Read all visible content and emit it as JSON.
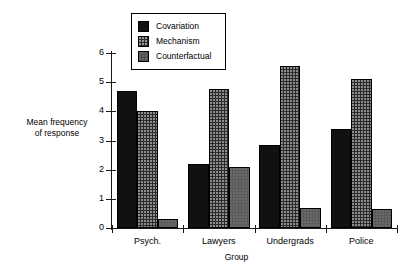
{
  "chart_data": {
    "type": "bar",
    "title": "",
    "xlabel": "Group",
    "ylabel": "Mean frequency\nof response",
    "ylabel_lines": [
      "Mean frequency",
      "of response"
    ],
    "categories": [
      "Psych.",
      "Lawyers",
      "Undergrads",
      "Police"
    ],
    "series": [
      {
        "name": "Covariation",
        "values": [
          4.7,
          2.2,
          2.85,
          3.4
        ]
      },
      {
        "name": "Mechanism",
        "values": [
          4.0,
          4.75,
          5.55,
          5.1
        ]
      },
      {
        "name": "Counterfactual",
        "values": [
          0.3,
          2.1,
          0.7,
          0.65
        ]
      }
    ],
    "ylim": [
      0,
      6
    ],
    "yticks": [
      0,
      1,
      2,
      3,
      4,
      5,
      6
    ],
    "ytick_labels": [
      "0",
      "1",
      "2",
      "3",
      "4",
      "5",
      "6"
    ],
    "grid": false,
    "legend_position": "top-left-inside",
    "series_colors": [
      "#111111",
      "#2b2b2b",
      "#5a5a5a"
    ],
    "axis_color": "#1a1a1a"
  },
  "legend": {
    "items": [
      {
        "label": "Covariation",
        "key": "covariation"
      },
      {
        "label": "Mechanism",
        "key": "mechanism"
      },
      {
        "label": "Counterfactual",
        "key": "counterfactual"
      }
    ]
  }
}
